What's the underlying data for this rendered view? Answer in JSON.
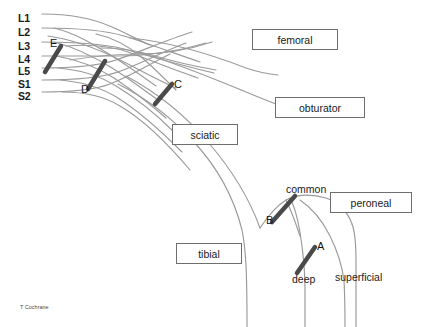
{
  "figure": {
    "credit": "T Cochrane",
    "colors": {
      "nerve_line": "#9a9a9a",
      "marker_bar": "#4a4a4a",
      "box_border": "#6e6e6e",
      "text": "#1a1a1a",
      "background": "#ffffff"
    }
  },
  "roots": [
    {
      "label": "L1",
      "x": 18,
      "y": 13
    },
    {
      "label": "L2",
      "x": 18,
      "y": 27
    },
    {
      "label": "L3",
      "x": 18,
      "y": 41
    },
    {
      "label": "L4",
      "x": 18,
      "y": 55
    },
    {
      "label": "L5",
      "x": 18,
      "y": 67
    },
    {
      "label": "S1",
      "x": 18,
      "y": 79
    },
    {
      "label": "S2",
      "x": 18,
      "y": 92
    }
  ],
  "nerve_boxes": [
    {
      "label": "femoral",
      "x": 252,
      "y": 29,
      "w": 86,
      "h": 21
    },
    {
      "label": "obturator",
      "x": 275,
      "y": 97,
      "w": 90,
      "h": 21
    },
    {
      "label": "sciatic",
      "x": 172,
      "y": 124,
      "w": 66,
      "h": 21
    },
    {
      "label": "peroneal",
      "x": 330,
      "y": 192,
      "w": 82,
      "h": 21
    },
    {
      "label": "tibial",
      "x": 176,
      "y": 243,
      "w": 66,
      "h": 21
    }
  ],
  "branch_labels": [
    {
      "label": "common",
      "x": 286,
      "y": 184
    },
    {
      "label": "deep",
      "x": 292,
      "y": 274
    },
    {
      "label": "superficial",
      "x": 335,
      "y": 272
    }
  ],
  "markers": [
    {
      "label": "A",
      "x1": 297,
      "y1": 273,
      "x2": 315,
      "y2": 247,
      "text_x": 317,
      "text_y": 241
    },
    {
      "label": "B",
      "x1": 272,
      "y1": 222,
      "x2": 295,
      "y2": 196,
      "text_x": 266,
      "text_y": 215
    },
    {
      "label": "C",
      "x1": 155,
      "y1": 104,
      "x2": 172,
      "y2": 84,
      "text_x": 174,
      "text_y": 79
    },
    {
      "label": "D",
      "x1": 88,
      "y1": 89,
      "x2": 105,
      "y2": 61,
      "text_x": 81,
      "text_y": 84
    },
    {
      "label": "E",
      "x1": 45,
      "y1": 72,
      "x2": 61,
      "y2": 46,
      "text_x": 50,
      "text_y": 38
    }
  ],
  "chart_data": {
    "type": "diagram",
    "nerve_roots": [
      "L1",
      "L2",
      "L3",
      "L4",
      "L5",
      "S1",
      "S2"
    ],
    "terminal_nerves": [
      "femoral",
      "obturator",
      "sciatic",
      "peroneal",
      "tibial"
    ],
    "sub_branches": [
      "common",
      "deep",
      "superficial"
    ],
    "block_markers": [
      "A",
      "B",
      "C",
      "D",
      "E"
    ]
  }
}
